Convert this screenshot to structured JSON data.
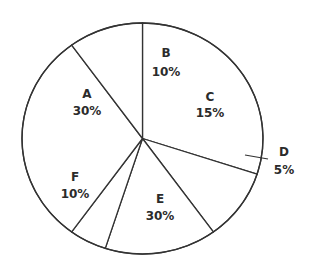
{
  "chart_data": {
    "type": "pie",
    "title": "",
    "categories": [
      "A",
      "B",
      "C",
      "D",
      "E",
      "F"
    ],
    "values": [
      30,
      10,
      15,
      5,
      30,
      10
    ],
    "value_labels": [
      "30%",
      "10%",
      "15%",
      "5%",
      "30%",
      "10%"
    ],
    "unit": "%",
    "legend": "none",
    "slices": [
      {
        "name": "A",
        "value": 30,
        "label": "A",
        "pct": "30%",
        "lx": 87,
        "ly": 98,
        "px": 87,
        "py": 115
      },
      {
        "name": "B",
        "value": 10,
        "label": "B",
        "pct": "10%",
        "lx": 166,
        "ly": 57,
        "px": 166,
        "py": 76
      },
      {
        "name": "C",
        "value": 15,
        "label": "C",
        "pct": "15%",
        "lx": 210,
        "ly": 101,
        "px": 210,
        "py": 117
      },
      {
        "name": "D",
        "value": 5,
        "label": "D",
        "pct": "5%",
        "lx": 284,
        "ly": 156,
        "px": 284,
        "py": 174,
        "outside": true
      },
      {
        "name": "E",
        "value": 30,
        "label": "E",
        "pct": "30%",
        "lx": 160,
        "ly": 203,
        "px": 160,
        "py": 220
      },
      {
        "name": "F",
        "value": 10,
        "label": "F",
        "pct": "10%",
        "lx": 75,
        "ly": 181,
        "px": 75,
        "py": 198
      }
    ]
  },
  "colors": {
    "fill": "#ffffff",
    "stroke": "#333333",
    "text": "#2b2b2b"
  }
}
